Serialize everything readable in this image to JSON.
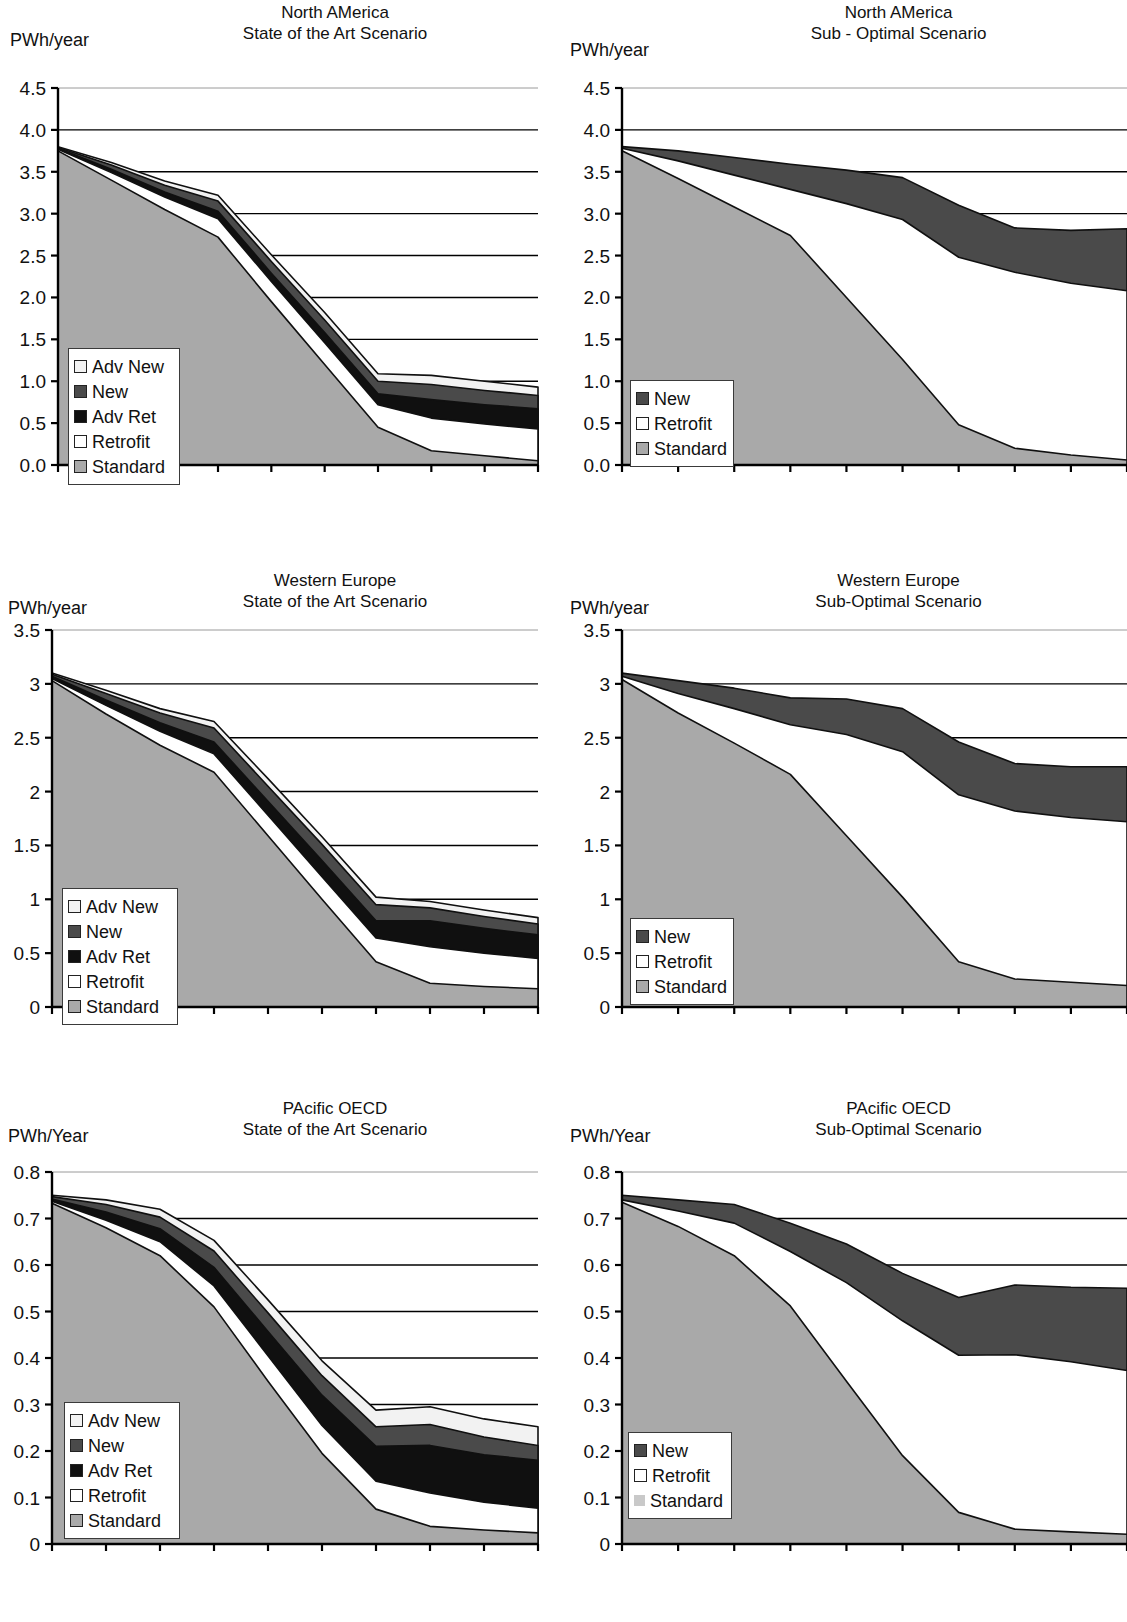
{
  "page": {
    "width": 1127,
    "height": 1622,
    "background": "#ffffff"
  },
  "colors": {
    "standard": "#a9a9a9",
    "retrofit": "#ffffff",
    "adv_ret": "#101010",
    "new": "#4a4a4a",
    "adv_new": "#f2f2f2",
    "axis": "#000000",
    "gridline": "#000000",
    "standard_light": "#c9c9c9"
  },
  "charts": [
    {
      "id": "north-america-sota",
      "title_line1": "North AMerica",
      "title_line2": "State of the Art Scenario",
      "unit_label": "PWh/year",
      "chart_data": {
        "type": "area",
        "title": "North AMerica — State of the Art Scenario",
        "xlabel": "",
        "ylabel": "PWh/year",
        "ylim": [
          0.0,
          4.5
        ],
        "ytick_labels": [
          "4.5",
          "4.0",
          "3.5",
          "3.0",
          "2.5",
          "2.0",
          "1.5",
          "1.0",
          "0.5",
          "0.0"
        ],
        "ytick_values": [
          4.5,
          4.0,
          3.5,
          3.0,
          2.5,
          2.0,
          1.5,
          1.0,
          0.5,
          0.0
        ],
        "grid": true,
        "legend_position": "inside-left",
        "x": [
          2005,
          2010,
          2015,
          2020,
          2025,
          2030,
          2035,
          2040,
          2045,
          2050
        ],
        "xtick_labels": [
          "2005",
          "2010",
          "2015",
          "2020",
          "2025",
          "2030",
          "2035",
          "2040",
          "2045",
          "2050"
        ],
        "stack_order": [
          "Standard",
          "Retrofit",
          "Adv Ret",
          "New",
          "Adv New"
        ],
        "series": [
          {
            "name": "Standard",
            "values": [
              3.75,
              3.4,
              3.05,
              2.72,
              1.95,
              1.2,
              0.45,
              0.17,
              0.11,
              0.05
            ]
          },
          {
            "name": "Retrofit",
            "values": [
              0.02,
              0.09,
              0.15,
              0.22,
              0.24,
              0.26,
              0.27,
              0.39,
              0.38,
              0.38
            ]
          },
          {
            "name": "Adv Ret",
            "values": [
              0.01,
              0.04,
              0.06,
              0.09,
              0.1,
              0.12,
              0.13,
              0.22,
              0.23,
              0.24
            ]
          },
          {
            "name": "New",
            "values": [
              0.01,
              0.05,
              0.08,
              0.12,
              0.14,
              0.15,
              0.15,
              0.18,
              0.17,
              0.16
            ]
          },
          {
            "name": "Adv New",
            "values": [
              0.01,
              0.03,
              0.05,
              0.07,
              0.08,
              0.09,
              0.09,
              0.11,
              0.11,
              0.1
            ]
          }
        ],
        "totals": [
          3.8,
          3.61,
          3.39,
          3.22,
          2.51,
          1.82,
          1.09,
          1.07,
          1.0,
          0.93
        ]
      },
      "legend": [
        {
          "label": "Adv New",
          "swatch": "adv_new",
          "style": "bordered"
        },
        {
          "label": "New",
          "swatch": "new",
          "style": "bordered"
        },
        {
          "label": "Adv Ret",
          "swatch": "adv_ret",
          "style": "bordered"
        },
        {
          "label": "Retrofit",
          "swatch": "retrofit",
          "style": "bordered"
        },
        {
          "label": "Standard",
          "swatch": "standard",
          "style": "bordered"
        }
      ]
    },
    {
      "id": "north-america-sub",
      "title_line1": "North AMerica",
      "title_line2": "Sub - Optimal Scenario",
      "unit_label": "PWh/year",
      "chart_data": {
        "type": "area",
        "title": "North AMerica — Sub - Optimal Scenario",
        "xlabel": "",
        "ylabel": "PWh/year",
        "ylim": [
          0.0,
          4.5
        ],
        "ytick_labels": [
          "4.5",
          "4.0",
          "3.5",
          "3.0",
          "2.5",
          "2.0",
          "1.5",
          "1.0",
          "0.5",
          "0.0"
        ],
        "ytick_values": [
          4.5,
          4.0,
          3.5,
          3.0,
          2.5,
          2.0,
          1.5,
          1.0,
          0.5,
          0.0
        ],
        "grid": true,
        "legend_position": "inside-left",
        "x": [
          2005,
          2010,
          2015,
          2020,
          2025,
          2030,
          2035,
          2040,
          2045,
          2050
        ],
        "xtick_labels": [
          "2005",
          "2010",
          "2015",
          "2020",
          "2025",
          "2030",
          "2035",
          "2040",
          "2045",
          "2050"
        ],
        "stack_order": [
          "Standard",
          "Retrofit",
          "New"
        ],
        "series": [
          {
            "name": "Standard",
            "values": [
              3.75,
              3.42,
              3.08,
              2.74,
              2.0,
              1.26,
              0.48,
              0.2,
              0.12,
              0.06
            ]
          },
          {
            "name": "Retrofit",
            "values": [
              0.03,
              0.21,
              0.38,
              0.55,
              1.12,
              1.67,
              2.0,
              2.1,
              2.05,
              2.02
            ]
          },
          {
            "name": "New",
            "values": [
              0.02,
              0.12,
              0.21,
              0.3,
              0.4,
              0.5,
              0.62,
              0.53,
              0.63,
              0.74
            ]
          }
        ],
        "totals": [
          3.8,
          3.75,
          3.67,
          3.59,
          3.52,
          3.43,
          3.1,
          2.83,
          2.8,
          2.82
        ]
      },
      "legend": [
        {
          "label": "New",
          "swatch": "new",
          "style": "bordered"
        },
        {
          "label": "Retrofit",
          "swatch": "retrofit",
          "style": "bordered"
        },
        {
          "label": "Standard",
          "swatch": "standard",
          "style": "bordered"
        }
      ]
    },
    {
      "id": "western-europe-sota",
      "title_line1": "Western Europe",
      "title_line2": "State of the Art Scenario",
      "unit_label": "PWh/year",
      "chart_data": {
        "type": "area",
        "title": "Western Europe — State of the Art Scenario",
        "xlabel": "",
        "ylabel": "PWh/year",
        "ylim": [
          0,
          3.5
        ],
        "ytick_labels": [
          "3.5",
          "3",
          "2.5",
          "2",
          "1.5",
          "1",
          "0.5",
          "0"
        ],
        "ytick_values": [
          3.5,
          3,
          2.5,
          2,
          1.5,
          1,
          0.5,
          0
        ],
        "grid": true,
        "legend_position": "inside-left",
        "x": [
          2005,
          2010,
          2015,
          2020,
          2025,
          2030,
          2035,
          2040,
          2045,
          2050
        ],
        "xtick_labels": [
          "2005",
          "2010",
          "2015",
          "2020",
          "2025",
          "2030",
          "2035",
          "2040",
          "2045",
          "2050"
        ],
        "stack_order": [
          "Standard",
          "Retrofit",
          "Adv Ret",
          "New",
          "Adv New"
        ],
        "series": [
          {
            "name": "Standard",
            "values": [
              3.03,
              2.72,
              2.43,
              2.18,
              1.59,
              1.0,
              0.42,
              0.22,
              0.19,
              0.17
            ]
          },
          {
            "name": "Retrofit",
            "values": [
              0.02,
              0.08,
              0.13,
              0.17,
              0.19,
              0.21,
              0.22,
              0.34,
              0.31,
              0.28
            ]
          },
          {
            "name": "Adv Ret",
            "values": [
              0.02,
              0.05,
              0.08,
              0.11,
              0.13,
              0.15,
              0.16,
              0.24,
              0.23,
              0.22
            ]
          },
          {
            "name": "New",
            "values": [
              0.02,
              0.06,
              0.09,
              0.13,
              0.14,
              0.15,
              0.15,
              0.12,
              0.11,
              0.1
            ]
          },
          {
            "name": "Adv New",
            "values": [
              0.01,
              0.03,
              0.04,
              0.06,
              0.07,
              0.07,
              0.07,
              0.06,
              0.06,
              0.06
            ]
          }
        ],
        "totals": [
          3.1,
          2.94,
          2.77,
          2.65,
          2.12,
          1.58,
          1.02,
          0.98,
          0.9,
          0.83
        ]
      },
      "legend": [
        {
          "label": "Adv New",
          "swatch": "adv_new",
          "style": "bordered"
        },
        {
          "label": "New",
          "swatch": "new",
          "style": "bordered"
        },
        {
          "label": "Adv Ret",
          "swatch": "adv_ret",
          "style": "bordered"
        },
        {
          "label": "Retrofit",
          "swatch": "retrofit",
          "style": "bordered"
        },
        {
          "label": "Standard",
          "swatch": "standard",
          "style": "bordered"
        }
      ]
    },
    {
      "id": "western-europe-sub",
      "title_line1": "Western Europe",
      "title_line2": "Sub-Optimal Scenario",
      "unit_label": "PWh/year",
      "chart_data": {
        "type": "area",
        "title": "Western Europe — Sub-Optimal Scenario",
        "xlabel": "",
        "ylabel": "PWh/year",
        "ylim": [
          0,
          3.5
        ],
        "ytick_labels": [
          "3.5",
          "3",
          "2.5",
          "2",
          "1.5",
          "1",
          "0.5",
          "0"
        ],
        "ytick_values": [
          3.5,
          3,
          2.5,
          2,
          1.5,
          1,
          0.5,
          0
        ],
        "grid": true,
        "legend_position": "inside-left",
        "x": [
          2005,
          2010,
          2015,
          2020,
          2025,
          2030,
          2035,
          2040,
          2045,
          2050
        ],
        "xtick_labels": [
          "2005",
          "2010",
          "2015",
          "2020",
          "2025",
          "2030",
          "2035",
          "2040",
          "2045",
          "2050"
        ],
        "stack_order": [
          "Standard",
          "Retrofit",
          "New"
        ],
        "series": [
          {
            "name": "Standard",
            "values": [
              3.04,
              2.73,
              2.45,
              2.16,
              1.59,
              1.02,
              0.42,
              0.26,
              0.23,
              0.2
            ]
          },
          {
            "name": "Retrofit",
            "values": [
              0.03,
              0.18,
              0.32,
              0.46,
              0.94,
              1.35,
              1.55,
              1.56,
              1.53,
              1.52
            ]
          },
          {
            "name": "New",
            "values": [
              0.03,
              0.12,
              0.19,
              0.25,
              0.33,
              0.4,
              0.49,
              0.44,
              0.47,
              0.51
            ]
          }
        ],
        "totals": [
          3.1,
          3.03,
          2.96,
          2.87,
          2.86,
          2.77,
          2.46,
          2.26,
          2.23,
          2.23
        ]
      },
      "legend": [
        {
          "label": "New",
          "swatch": "new",
          "style": "bordered"
        },
        {
          "label": "Retrofit",
          "swatch": "retrofit",
          "style": "bordered"
        },
        {
          "label": "Standard",
          "swatch": "standard",
          "style": "bordered"
        }
      ]
    },
    {
      "id": "pacific-oecd-sota",
      "title_line1": "PAcific OECD",
      "title_line2": "State of the Art Scenario",
      "unit_label": "PWh/Year",
      "chart_data": {
        "type": "area",
        "title": "PAcific OECD — State of the Art Scenario",
        "xlabel": "",
        "ylabel": "PWh/Year",
        "ylim": [
          0,
          0.8
        ],
        "ytick_labels": [
          "0.8",
          "0.7",
          "0.6",
          "0.5",
          "0.4",
          "0.3",
          "0.2",
          "0.1",
          "0"
        ],
        "ytick_values": [
          0.8,
          0.7,
          0.6,
          0.5,
          0.4,
          0.3,
          0.2,
          0.1,
          0
        ],
        "grid": true,
        "legend_position": "inside-left",
        "x": [
          2005,
          2010,
          2015,
          2020,
          2025,
          2030,
          2035,
          2040,
          2045,
          2050
        ],
        "xtick_labels": [
          "2005",
          "2010",
          "2015",
          "2020",
          "2025",
          "2030",
          "2035",
          "2040",
          "2045",
          "2050"
        ],
        "stack_order": [
          "Standard",
          "Retrofit",
          "Adv Ret",
          "New",
          "Adv New"
        ],
        "series": [
          {
            "name": "Standard",
            "values": [
              0.733,
              0.68,
              0.62,
              0.51,
              0.35,
              0.195,
              0.075,
              0.038,
              0.03,
              0.024
            ]
          },
          {
            "name": "Retrofit",
            "values": [
              0.004,
              0.016,
              0.03,
              0.045,
              0.055,
              0.06,
              0.06,
              0.072,
              0.06,
              0.053
            ]
          },
          {
            "name": "Adv Ret",
            "values": [
              0.005,
              0.018,
              0.028,
              0.04,
              0.052,
              0.065,
              0.075,
              0.102,
              0.102,
              0.103
            ]
          },
          {
            "name": "New",
            "values": [
              0.005,
              0.016,
              0.025,
              0.035,
              0.04,
              0.042,
              0.042,
              0.045,
              0.038,
              0.032
            ]
          },
          {
            "name": "Adv New",
            "values": [
              0.003,
              0.01,
              0.017,
              0.023,
              0.028,
              0.032,
              0.036,
              0.038,
              0.039,
              0.04
            ]
          }
        ],
        "totals": [
          0.75,
          0.74,
          0.72,
          0.653,
          0.525,
          0.394,
          0.288,
          0.295,
          0.269,
          0.252
        ]
      },
      "legend": [
        {
          "label": "Adv New",
          "swatch": "adv_new",
          "style": "bordered"
        },
        {
          "label": "New",
          "swatch": "new",
          "style": "bordered"
        },
        {
          "label": "Adv Ret",
          "swatch": "adv_ret",
          "style": "bordered"
        },
        {
          "label": "Retrofit",
          "swatch": "retrofit",
          "style": "bordered"
        },
        {
          "label": "Standard",
          "swatch": "standard",
          "style": "bordered"
        }
      ]
    },
    {
      "id": "pacific-oecd-sub",
      "title_line1": "PAcific OECD",
      "title_line2": "Sub-Optimal Scenario",
      "unit_label": "PWh/Year",
      "chart_data": {
        "type": "area",
        "title": "PAcific OECD — Sub-Optimal Scenario",
        "xlabel": "",
        "ylabel": "PWh/Year",
        "ylim": [
          0,
          0.8
        ],
        "ytick_labels": [
          "0.8",
          "0.7",
          "0.6",
          "0.5",
          "0.4",
          "0.3",
          "0.2",
          "0.1",
          "0"
        ],
        "ytick_values": [
          0.8,
          0.7,
          0.6,
          0.5,
          0.4,
          0.3,
          0.2,
          0.1,
          0
        ],
        "grid": true,
        "legend_position": "inside-left",
        "x": [
          2005,
          2010,
          2015,
          2020,
          2025,
          2030,
          2035,
          2040,
          2045,
          2050
        ],
        "xtick_labels": [
          "2005",
          "2010",
          "2015",
          "2020",
          "2025",
          "2030",
          "2035",
          "2040",
          "2045",
          "2050"
        ],
        "stack_order": [
          "Standard",
          "Retrofit",
          "New"
        ],
        "series": [
          {
            "name": "Standard",
            "values": [
              0.735,
              0.683,
              0.62,
              0.512,
              0.35,
              0.19,
              0.068,
              0.032,
              0.026,
              0.021
            ]
          },
          {
            "name": "Retrofit",
            "values": [
              0.005,
              0.033,
              0.07,
              0.117,
              0.212,
              0.29,
              0.338,
              0.375,
              0.366,
              0.352
            ]
          },
          {
            "name": "New",
            "values": [
              0.01,
              0.024,
              0.04,
              0.061,
              0.083,
              0.102,
              0.124,
              0.15,
              0.16,
              0.177
            ]
          }
        ],
        "totals": [
          0.75,
          0.74,
          0.73,
          0.69,
          0.645,
          0.582,
          0.53,
          0.557,
          0.552,
          0.55
        ]
      },
      "legend": [
        {
          "label": "New",
          "swatch": "new",
          "style": "bordered"
        },
        {
          "label": "Retrofit",
          "swatch": "retrofit",
          "style": "bordered"
        },
        {
          "label": "Standard",
          "swatch": "standard_light",
          "style": "plain"
        }
      ]
    }
  ]
}
